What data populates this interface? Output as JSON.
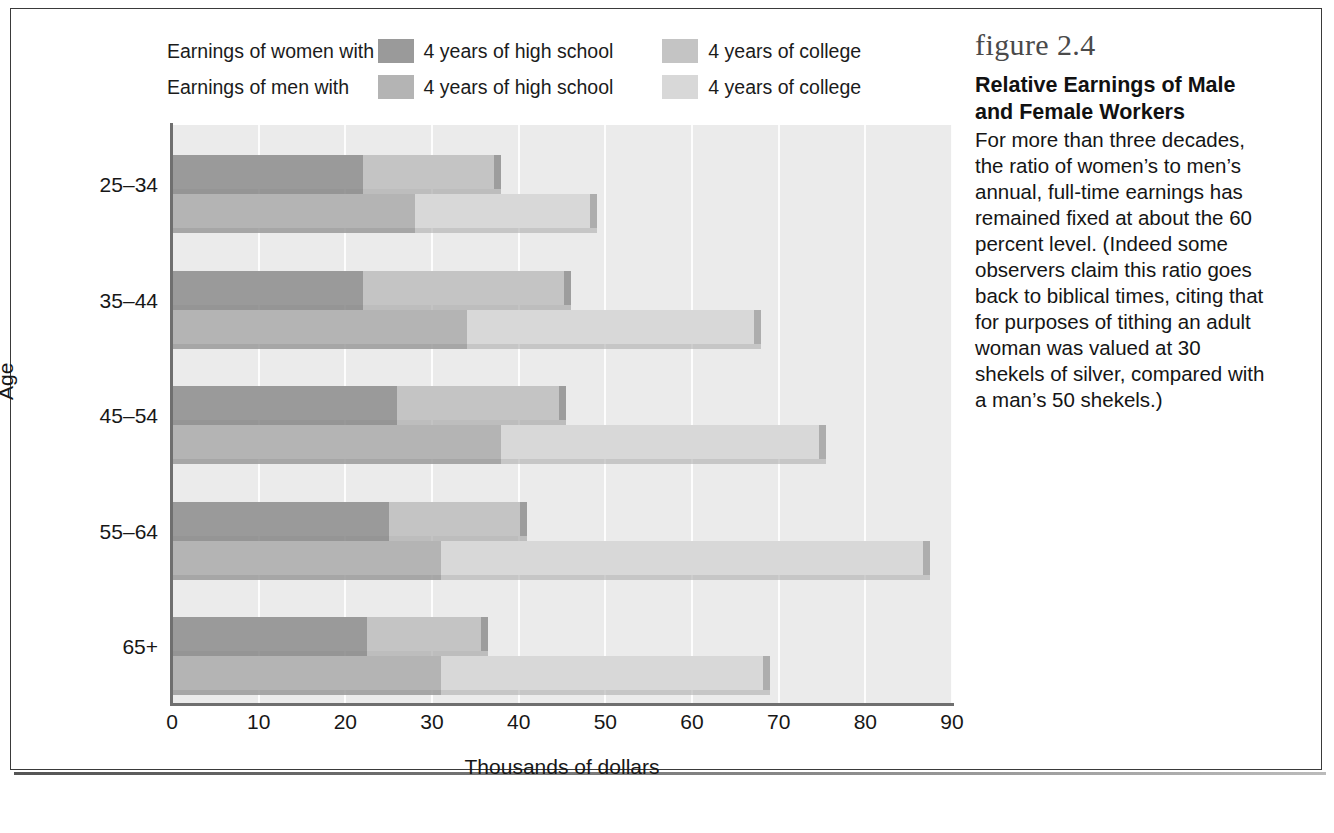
{
  "figure": {
    "number": "figure 2.4",
    "title": "Relative Earnings of Male and Female Workers",
    "body": "For more than three decades, the ratio of women’s to men’s annual, full-time earnings has remained fixed at about the 60 percent level.  (Indeed some observers claim this ratio goes back to biblical times, citing that for purposes of tithing an adult woman was valued at 30 shekels of silver, compared with a man’s 50 shekels.)"
  },
  "legend": {
    "rows": [
      {
        "label": "Earnings of women with",
        "hs_text": "4 years of high school",
        "hs_color": "#9a9a9a",
        "col_text": "4 years of college",
        "col_color": "#c4c4c4"
      },
      {
        "label": "Earnings of men with",
        "hs_text": "4 years of high school",
        "hs_color": "#b4b4b4",
        "col_text": "4 years of college",
        "col_color": "#d8d8d8"
      }
    ]
  },
  "axes": {
    "xlabel": "Thousands of dollars",
    "ylabel": "Age",
    "xticks": [
      "0",
      "10",
      "20",
      "30",
      "40",
      "50",
      "60",
      "70",
      "80",
      "90"
    ],
    "yticks": [
      "25–34",
      "35–44",
      "45–54",
      "55–64",
      "65+"
    ]
  },
  "chart_data": {
    "type": "bar",
    "orientation": "horizontal",
    "title": "Relative Earnings of Male and Female Workers",
    "xlabel": "Thousands of dollars",
    "ylabel": "Age",
    "xlim": [
      0,
      90
    ],
    "xticks": [
      0,
      10,
      20,
      30,
      40,
      50,
      60,
      70,
      80,
      90
    ],
    "grid": true,
    "legend_position": "top",
    "categories": [
      "25–34",
      "35–44",
      "45–54",
      "55–64",
      "65+"
    ],
    "series": [
      {
        "name": "Earnings of women with 4 years of high school",
        "color": "#9a9a9a",
        "values": [
          22,
          22,
          26,
          25,
          22.5
        ]
      },
      {
        "name": "Earnings of women with 4 years of college",
        "color": "#c4c4c4",
        "values": [
          38,
          46,
          45.5,
          41,
          36.5
        ]
      },
      {
        "name": "Earnings of men with 4 years of high school",
        "color": "#b4b4b4",
        "values": [
          28,
          34,
          38,
          31,
          31
        ]
      },
      {
        "name": "Earnings of men with 4 years of college",
        "color": "#d8d8d8",
        "values": [
          49,
          68,
          75.5,
          87.5,
          69
        ]
      }
    ]
  }
}
